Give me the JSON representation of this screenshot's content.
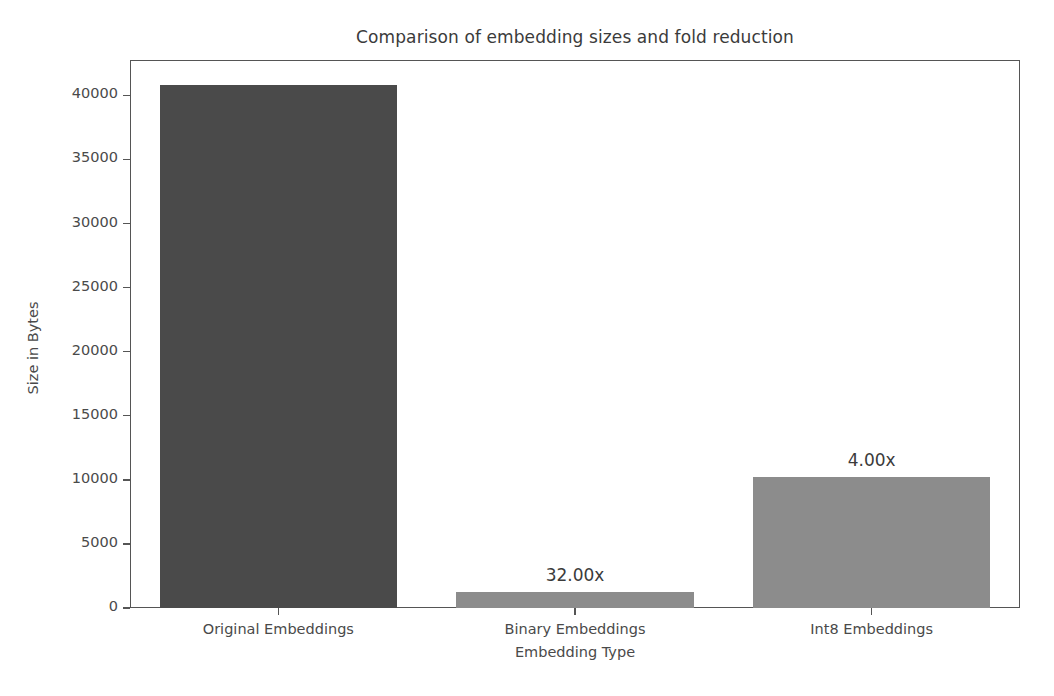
{
  "chart_data": {
    "type": "bar",
    "title": "Comparison of embedding sizes and fold reduction",
    "xlabel": "Embedding Type",
    "ylabel": "Size in Bytes",
    "categories": [
      "Original Embeddings",
      "Binary Embeddings",
      "Int8 Embeddings"
    ],
    "values": [
      40832,
      1276,
      10208
    ],
    "annotations": [
      "",
      "32.00x",
      "4.00x"
    ],
    "bar_colors": [
      "#4a4a4a",
      "#8c8c8c",
      "#8c8c8c"
    ],
    "ylim": [
      0,
      42760
    ],
    "yticks": [
      0,
      5000,
      10000,
      15000,
      20000,
      25000,
      30000,
      35000,
      40000
    ],
    "ytick_labels": [
      "0",
      "5000",
      "10000",
      "15000",
      "20000",
      "25000",
      "30000",
      "35000",
      "40000"
    ],
    "grid": false,
    "legend": null
  },
  "figure": {
    "background_color": "#ffffff",
    "axes_edge_color": "#555555",
    "text_color": "#4a4a4a"
  }
}
